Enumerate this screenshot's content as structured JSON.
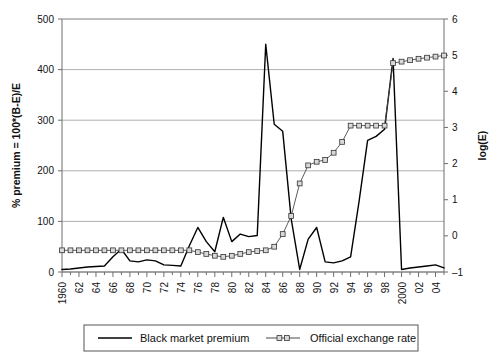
{
  "chart_data": {
    "type": "line",
    "title": "",
    "xlabel": "",
    "ylabel": "% premium = 100*(B-E)/E",
    "y2label": "log(E)",
    "grid": true,
    "legend_position": "bottom",
    "xlim": [
      1960,
      2005
    ],
    "ylim": [
      0,
      500
    ],
    "y2lim": [
      -1,
      6
    ],
    "yticks": [
      0,
      100,
      200,
      300,
      400,
      500
    ],
    "y2ticks": [
      -1,
      0,
      1,
      2,
      3,
      4,
      5,
      6
    ],
    "x": [
      1960,
      1961,
      1962,
      1963,
      1964,
      1965,
      1966,
      1967,
      1968,
      1969,
      1970,
      1971,
      1972,
      1973,
      1974,
      1975,
      1976,
      1977,
      1978,
      1979,
      1980,
      1981,
      1982,
      1983,
      1984,
      1985,
      1986,
      1987,
      1988,
      1989,
      1990,
      1991,
      1992,
      1993,
      1994,
      1995,
      1996,
      1997,
      1998,
      1999,
      2000,
      2001,
      2002,
      2003,
      2004,
      2005
    ],
    "xtick_labels": [
      "1960",
      "62",
      "64",
      "66",
      "68",
      "70",
      "72",
      "74",
      "76",
      "78",
      "80",
      "82",
      "84",
      "86",
      "88",
      "90",
      "92",
      "94",
      "96",
      "98",
      "2000",
      "02",
      "04"
    ],
    "series": [
      {
        "name": "Black market premium",
        "axis": "left",
        "marker": "none",
        "color": "#000000",
        "values": [
          5,
          6,
          8,
          10,
          11,
          12,
          30,
          45,
          22,
          20,
          24,
          22,
          14,
          13,
          12,
          52,
          88,
          60,
          40,
          108,
          60,
          75,
          70,
          72,
          450,
          292,
          278,
          105,
          5,
          65,
          88,
          20,
          18,
          22,
          30,
          140,
          260,
          268,
          282,
          422,
          5,
          8,
          10,
          12,
          14,
          8
        ]
      },
      {
        "name": "Official exchange rate",
        "axis": "right",
        "marker": "square",
        "color": "#4a4a4a",
        "values": [
          -0.4,
          -0.4,
          -0.4,
          -0.4,
          -0.4,
          -0.4,
          -0.4,
          -0.4,
          -0.4,
          -0.4,
          -0.4,
          -0.4,
          -0.4,
          -0.4,
          -0.4,
          -0.4,
          -0.45,
          -0.5,
          -0.55,
          -0.58,
          -0.55,
          -0.5,
          -0.45,
          -0.42,
          -0.4,
          -0.3,
          0.05,
          0.55,
          1.45,
          1.95,
          2.05,
          2.1,
          2.3,
          2.6,
          3.05,
          3.05,
          3.05,
          3.05,
          3.05,
          4.78,
          4.82,
          4.86,
          4.9,
          4.93,
          4.96,
          4.99
        ]
      }
    ]
  },
  "legend": {
    "entries": [
      {
        "label": "Black market premium",
        "style": "line"
      },
      {
        "label": "Official exchange rate",
        "style": "line-square"
      }
    ]
  }
}
